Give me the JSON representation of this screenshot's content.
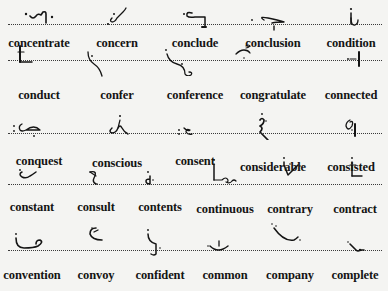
{
  "page": {
    "kind": "shorthand-outline-list",
    "rows": [
      {
        "words": [
          "concentrate",
          "concern",
          "conclude",
          "conclusion",
          "condition"
        ]
      },
      {
        "words": [
          "conduct",
          "confer",
          "conference",
          "congratulate",
          "connected"
        ]
      },
      {
        "words": [
          "conquest",
          "conscious",
          "consent",
          "considerable",
          "consisted"
        ]
      },
      {
        "words": [
          "constant",
          "consult",
          "contents",
          "continuous",
          "contrary",
          "contract"
        ]
      },
      {
        "words": [
          "convention",
          "convoy",
          "confident",
          "common",
          "company",
          "complete"
        ]
      }
    ]
  },
  "outlines": [
    "concentrate-outline",
    "concern-outline",
    "conclude-outline",
    "conclusion-outline",
    "condition-outline",
    "conduct-outline",
    "confer-outline",
    "conference-outline",
    "congratulate-outline",
    "connected-outline",
    "conquest-outline",
    "conscious-outline",
    "consent-outline",
    "considerable-outline",
    "consisted-outline",
    "constant-outline",
    "consult-outline",
    "contents-outline",
    "continuous-outline",
    "contrary-outline",
    "contract-outline",
    "convention-outline",
    "convoy-outline",
    "confident-outline",
    "common-outline",
    "company-outline",
    "complete-outline"
  ]
}
